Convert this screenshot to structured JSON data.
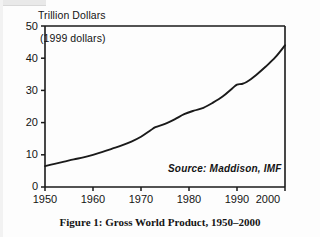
{
  "figure": {
    "caption": "Figure 1:  Gross World Product, 1950–2000",
    "axis_title": "Trillion Dollars",
    "inner_note": "(1999 dollars)",
    "source_note": "Source: Maddison, IMF"
  },
  "colors": {
    "line": "#1a1a1a",
    "axis": "#1a1a1a",
    "background": "#fdfdfd",
    "text": "#141414"
  },
  "chart_data": {
    "type": "line",
    "title": "Figure 1:  Gross World Product, 1950–2000",
    "subtitle": "(1999 dollars)",
    "xlabel": "",
    "ylabel": "Trillion Dollars",
    "annotation": "Source: Maddison, IMF",
    "grid": false,
    "legend": "none",
    "xlim": [
      1950,
      2000
    ],
    "ylim": [
      0,
      50
    ],
    "xticks": [
      1950,
      1960,
      1970,
      1980,
      1990,
      2000
    ],
    "xtick_labels": [
      "1950",
      "1960",
      "1970",
      "1980",
      "1990",
      "2000"
    ],
    "yticks": [
      0,
      10,
      20,
      30,
      40,
      50
    ],
    "ytick_labels": [
      "0",
      "10",
      "20",
      "30",
      "40",
      "50"
    ],
    "series": [
      {
        "name": "Gross World Product",
        "x": [
          1950,
          1952,
          1954,
          1956,
          1958,
          1960,
          1962,
          1964,
          1966,
          1968,
          1970,
          1972,
          1973,
          1975,
          1977,
          1979,
          1981,
          1983,
          1985,
          1987,
          1989,
          1990,
          1991,
          1992,
          1994,
          1996,
          1998,
          2000
        ],
        "values": [
          6.5,
          7.2,
          7.9,
          8.6,
          9.2,
          10.0,
          10.9,
          11.9,
          12.9,
          14.1,
          15.6,
          17.6,
          18.6,
          19.6,
          21.0,
          22.6,
          23.7,
          24.6,
          26.2,
          28.1,
          30.6,
          31.8,
          32.0,
          32.6,
          34.8,
          37.4,
          40.3,
          44.0
        ]
      }
    ]
  }
}
